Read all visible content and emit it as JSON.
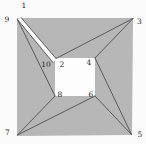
{
  "figure": {
    "canvas": {
      "width": 146,
      "height": 144
    },
    "colors": {
      "background": "#fbfbfb",
      "shape_fill": "#b7b7b7",
      "hole_fill": "#fdfdfd",
      "edge_line": "#4f4f4f",
      "label_text": "#1c1c1c"
    },
    "edge_stroke_width": 0.9,
    "outer_square": [
      [
        17,
        18
      ],
      [
        133,
        18
      ],
      [
        132,
        135
      ],
      [
        17,
        136
      ]
    ],
    "inner_square": [
      [
        55,
        58
      ],
      [
        95,
        58
      ],
      [
        95,
        96
      ],
      [
        55,
        96
      ]
    ],
    "notch_order": [
      "1",
      "2",
      "10",
      "9"
    ],
    "vertices": [
      {
        "label": "1",
        "x": 21,
        "y": 17.5,
        "lx": 24,
        "ly": 5.5
      },
      {
        "label": "2",
        "x": 56,
        "y": 58.5,
        "lx": 62,
        "ly": 64.5
      },
      {
        "label": "3",
        "x": 133,
        "y": 18.5,
        "lx": 139.5,
        "ly": 21.5
      },
      {
        "label": "4",
        "x": 95,
        "y": 58,
        "lx": 89,
        "ly": 62.5
      },
      {
        "label": "5",
        "x": 131.5,
        "y": 134.5,
        "lx": 140,
        "ly": 134
      },
      {
        "label": "6",
        "x": 95,
        "y": 96,
        "lx": 91,
        "ly": 94.5
      },
      {
        "label": "7",
        "x": 17.5,
        "y": 135,
        "lx": 7.5,
        "ly": 132
      },
      {
        "label": "8",
        "x": 55,
        "y": 96,
        "lx": 60,
        "ly": 94.5
      },
      {
        "label": "9",
        "x": 17.5,
        "y": 19.5,
        "lx": 7,
        "ly": 19.5
      },
      {
        "label": "10",
        "x": 53,
        "y": 62.5,
        "lx": 46,
        "ly": 64.5
      }
    ],
    "edges": [
      [
        "1",
        "2"
      ],
      [
        "2",
        "3"
      ],
      [
        "3",
        "4"
      ],
      [
        "4",
        "5"
      ],
      [
        "5",
        "6"
      ],
      [
        "6",
        "7"
      ],
      [
        "7",
        "8"
      ],
      [
        "8",
        "9"
      ],
      [
        "9",
        "10"
      ]
    ]
  }
}
